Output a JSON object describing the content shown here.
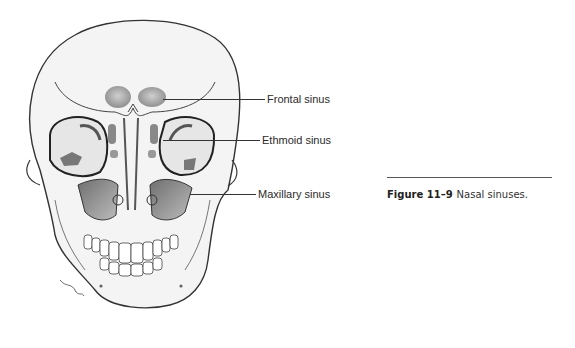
{
  "figure": {
    "labels": [
      {
        "text": "Frontal sinus"
      },
      {
        "text": "Ethmoid sinus"
      },
      {
        "text": "Maxillary sinus"
      }
    ],
    "caption": {
      "number": "Figure 11–9",
      "text": "Nasal sinuses."
    }
  }
}
